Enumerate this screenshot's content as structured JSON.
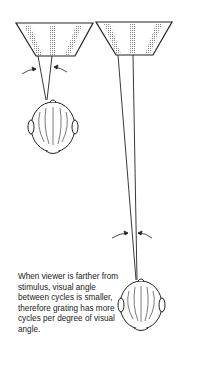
{
  "caption": "When viewer is farther from stimulus, visual angle between cycles is smaller, therefore grating has more cycles per degree of visual angle.",
  "figure": {
    "left": {
      "label": "near-viewer",
      "grating_cycles": 3
    },
    "right": {
      "label": "far-viewer",
      "grating_cycles": 3
    }
  },
  "colors": {
    "ink": "#222222",
    "background": "#ffffff"
  }
}
